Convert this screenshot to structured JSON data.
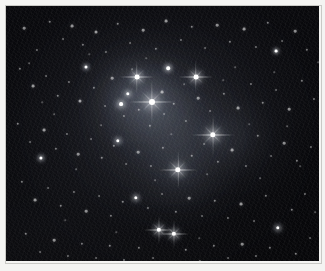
{
  "image": {
    "kind": "astrophotograph",
    "subject": "Pleiades open star cluster with reflection nebulosity",
    "presentation": "monochrome photographic print with light paper border",
    "background_color": "#050507",
    "star_color": "#ffffff",
    "nebula_color": "#aebacd",
    "border_color": "#f4f4f2",
    "plate": {
      "x": 6,
      "y": 6,
      "width": 313,
      "height": 255
    }
  },
  "nebulosity": [
    {
      "name": "core-reflection-glow",
      "cx": 148,
      "cy": 108,
      "rx": 62,
      "ry": 56,
      "opacity": 0.42,
      "blur": 26
    },
    {
      "name": "maia-nebula-glow",
      "cx": 130,
      "cy": 80,
      "rx": 34,
      "ry": 30,
      "opacity": 0.4,
      "blur": 18
    },
    {
      "name": "alcyone-nebula-glow",
      "cx": 146,
      "cy": 96,
      "rx": 30,
      "ry": 26,
      "opacity": 0.46,
      "blur": 16
    },
    {
      "name": "merope-nebula-glow",
      "cx": 172,
      "cy": 166,
      "rx": 34,
      "ry": 30,
      "opacity": 0.4,
      "blur": 18
    },
    {
      "name": "east-streak-nebula-glow",
      "cx": 222,
      "cy": 132,
      "rx": 44,
      "ry": 26,
      "opacity": 0.38,
      "blur": 18
    },
    {
      "name": "electra-nebula-glow",
      "cx": 116,
      "cy": 94,
      "rx": 24,
      "ry": 22,
      "opacity": 0.3,
      "blur": 14
    },
    {
      "name": "bridge-nebula-glow",
      "cx": 170,
      "cy": 132,
      "rx": 40,
      "ry": 34,
      "opacity": 0.22,
      "blur": 22
    },
    {
      "name": "outer-halo-glow",
      "cx": 162,
      "cy": 122,
      "rx": 92,
      "ry": 80,
      "opacity": 0.16,
      "blur": 40
    }
  ],
  "bright_stars": [
    {
      "name": "alcyone",
      "x": 146,
      "y": 96,
      "size": 6.0,
      "halo": 26,
      "spikes": true,
      "brightness": 1.0
    },
    {
      "name": "maia",
      "x": 131,
      "y": 71,
      "size": 4.8,
      "halo": 19,
      "spikes": true,
      "brightness": 0.92
    },
    {
      "name": "atlas",
      "x": 190,
      "y": 71,
      "size": 4.8,
      "halo": 19,
      "spikes": true,
      "brightness": 0.92
    },
    {
      "name": "merope",
      "x": 172,
      "y": 164,
      "size": 5.4,
      "halo": 22,
      "spikes": true,
      "brightness": 0.96
    },
    {
      "name": "east-nebula-star",
      "x": 207,
      "y": 129,
      "size": 5.4,
      "halo": 24,
      "spikes": true,
      "brightness": 0.96
    },
    {
      "name": "electra",
      "x": 115,
      "y": 98,
      "size": 3.8,
      "halo": 14,
      "spikes": false,
      "brightness": 0.84
    },
    {
      "name": "taygeta",
      "x": 122,
      "y": 88,
      "size": 3.4,
      "halo": 12,
      "spikes": false,
      "brightness": 0.8
    },
    {
      "name": "pleione",
      "x": 162,
      "y": 62,
      "size": 3.6,
      "halo": 13,
      "spikes": false,
      "brightness": 0.82
    },
    {
      "name": "asterope",
      "x": 112,
      "y": 135,
      "size": 3.4,
      "halo": 12,
      "spikes": false,
      "brightness": 0.78
    },
    {
      "name": "lower-pair-west",
      "x": 153,
      "y": 224,
      "size": 4.4,
      "halo": 17,
      "spikes": true,
      "brightness": 0.9
    },
    {
      "name": "lower-pair-east",
      "x": 168,
      "y": 228,
      "size": 4.4,
      "halo": 17,
      "spikes": true,
      "brightness": 0.9
    },
    {
      "name": "south-field-star",
      "x": 130,
      "y": 192,
      "size": 3.4,
      "halo": 12,
      "spikes": false,
      "brightness": 0.8
    },
    {
      "name": "west-field-star",
      "x": 35,
      "y": 152,
      "size": 3.2,
      "halo": 11,
      "spikes": false,
      "brightness": 0.76
    },
    {
      "name": "east-field-star",
      "x": 272,
      "y": 222,
      "size": 3.4,
      "halo": 12,
      "spikes": false,
      "brightness": 0.78
    },
    {
      "name": "north-field-star",
      "x": 80,
      "y": 61,
      "size": 3.0,
      "halo": 10,
      "spikes": false,
      "brightness": 0.74
    },
    {
      "name": "northeast-field-star",
      "x": 270,
      "y": 45,
      "size": 2.8,
      "halo": 9,
      "spikes": false,
      "brightness": 0.72
    }
  ],
  "field_stars": [
    {
      "x": 18,
      "y": 22,
      "s": 1.4,
      "b": 0.5
    },
    {
      "x": 31,
      "y": 44,
      "s": 1.1,
      "b": 0.4
    },
    {
      "x": 44,
      "y": 16,
      "s": 1.3,
      "b": 0.46
    },
    {
      "x": 57,
      "y": 33,
      "s": 1.0,
      "b": 0.38
    },
    {
      "x": 66,
      "y": 20,
      "s": 1.5,
      "b": 0.55
    },
    {
      "x": 77,
      "y": 39,
      "s": 1.2,
      "b": 0.44
    },
    {
      "x": 90,
      "y": 26,
      "s": 1.6,
      "b": 0.58
    },
    {
      "x": 100,
      "y": 46,
      "s": 1.1,
      "b": 0.4
    },
    {
      "x": 112,
      "y": 18,
      "s": 1.3,
      "b": 0.48
    },
    {
      "x": 124,
      "y": 37,
      "s": 1.0,
      "b": 0.36
    },
    {
      "x": 137,
      "y": 24,
      "s": 1.4,
      "b": 0.52
    },
    {
      "x": 150,
      "y": 43,
      "s": 1.2,
      "b": 0.44
    },
    {
      "x": 160,
      "y": 15,
      "s": 1.5,
      "b": 0.55
    },
    {
      "x": 175,
      "y": 34,
      "s": 1.1,
      "b": 0.4
    },
    {
      "x": 186,
      "y": 21,
      "s": 1.3,
      "b": 0.48
    },
    {
      "x": 199,
      "y": 42,
      "s": 1.0,
      "b": 0.36
    },
    {
      "x": 211,
      "y": 19,
      "s": 1.4,
      "b": 0.52
    },
    {
      "x": 224,
      "y": 36,
      "s": 1.2,
      "b": 0.44
    },
    {
      "x": 238,
      "y": 23,
      "s": 1.5,
      "b": 0.56
    },
    {
      "x": 250,
      "y": 41,
      "s": 1.1,
      "b": 0.4
    },
    {
      "x": 262,
      "y": 17,
      "s": 1.3,
      "b": 0.47
    },
    {
      "x": 276,
      "y": 35,
      "s": 1.0,
      "b": 0.36
    },
    {
      "x": 289,
      "y": 25,
      "s": 1.4,
      "b": 0.52
    },
    {
      "x": 301,
      "y": 44,
      "s": 1.2,
      "b": 0.43
    },
    {
      "x": 14,
      "y": 63,
      "s": 1.2,
      "b": 0.44
    },
    {
      "x": 27,
      "y": 80,
      "s": 1.5,
      "b": 0.56
    },
    {
      "x": 40,
      "y": 70,
      "s": 1.0,
      "b": 0.36
    },
    {
      "x": 52,
      "y": 90,
      "s": 1.3,
      "b": 0.48
    },
    {
      "x": 63,
      "y": 76,
      "s": 1.1,
      "b": 0.4
    },
    {
      "x": 74,
      "y": 95,
      "s": 1.6,
      "b": 0.6
    },
    {
      "x": 88,
      "y": 82,
      "s": 1.2,
      "b": 0.44
    },
    {
      "x": 99,
      "y": 100,
      "s": 1.0,
      "b": 0.36
    },
    {
      "x": 106,
      "y": 72,
      "s": 1.4,
      "b": 0.52
    },
    {
      "x": 118,
      "y": 110,
      "s": 1.1,
      "b": 0.4
    },
    {
      "x": 133,
      "y": 104,
      "s": 1.3,
      "b": 0.48
    },
    {
      "x": 144,
      "y": 120,
      "s": 1.2,
      "b": 0.44
    },
    {
      "x": 156,
      "y": 86,
      "s": 1.5,
      "b": 0.56
    },
    {
      "x": 158,
      "y": 108,
      "s": 1.0,
      "b": 0.36
    },
    {
      "x": 168,
      "y": 98,
      "s": 1.3,
      "b": 0.48
    },
    {
      "x": 180,
      "y": 115,
      "s": 1.1,
      "b": 0.4
    },
    {
      "x": 192,
      "y": 92,
      "s": 1.4,
      "b": 0.52
    },
    {
      "x": 204,
      "y": 105,
      "s": 1.0,
      "b": 0.36
    },
    {
      "x": 218,
      "y": 88,
      "s": 1.2,
      "b": 0.44
    },
    {
      "x": 232,
      "y": 102,
      "s": 1.5,
      "b": 0.56
    },
    {
      "x": 245,
      "y": 78,
      "s": 1.1,
      "b": 0.4
    },
    {
      "x": 257,
      "y": 97,
      "s": 1.3,
      "b": 0.48
    },
    {
      "x": 270,
      "y": 84,
      "s": 1.0,
      "b": 0.36
    },
    {
      "x": 283,
      "y": 103,
      "s": 1.4,
      "b": 0.52
    },
    {
      "x": 296,
      "y": 75,
      "s": 1.2,
      "b": 0.44
    },
    {
      "x": 308,
      "y": 93,
      "s": 1.1,
      "b": 0.4
    },
    {
      "x": 12,
      "y": 118,
      "s": 1.3,
      "b": 0.48
    },
    {
      "x": 24,
      "y": 136,
      "s": 1.0,
      "b": 0.36
    },
    {
      "x": 38,
      "y": 124,
      "s": 1.5,
      "b": 0.56
    },
    {
      "x": 50,
      "y": 143,
      "s": 1.2,
      "b": 0.44
    },
    {
      "x": 61,
      "y": 128,
      "s": 1.1,
      "b": 0.4
    },
    {
      "x": 72,
      "y": 148,
      "s": 1.4,
      "b": 0.52
    },
    {
      "x": 85,
      "y": 133,
      "s": 1.0,
      "b": 0.36
    },
    {
      "x": 96,
      "y": 152,
      "s": 1.3,
      "b": 0.48
    },
    {
      "x": 108,
      "y": 140,
      "s": 1.2,
      "b": 0.44
    },
    {
      "x": 120,
      "y": 158,
      "s": 1.0,
      "b": 0.36
    },
    {
      "x": 132,
      "y": 146,
      "s": 1.4,
      "b": 0.52
    },
    {
      "x": 145,
      "y": 160,
      "s": 1.1,
      "b": 0.4
    },
    {
      "x": 157,
      "y": 142,
      "s": 1.2,
      "b": 0.44
    },
    {
      "x": 186,
      "y": 150,
      "s": 1.3,
      "b": 0.48
    },
    {
      "x": 198,
      "y": 138,
      "s": 1.0,
      "b": 0.36
    },
    {
      "x": 212,
      "y": 156,
      "s": 1.2,
      "b": 0.44
    },
    {
      "x": 226,
      "y": 144,
      "s": 1.5,
      "b": 0.56
    },
    {
      "x": 240,
      "y": 160,
      "s": 1.1,
      "b": 0.4
    },
    {
      "x": 252,
      "y": 130,
      "s": 1.3,
      "b": 0.48
    },
    {
      "x": 265,
      "y": 150,
      "s": 1.0,
      "b": 0.36
    },
    {
      "x": 278,
      "y": 137,
      "s": 1.4,
      "b": 0.52
    },
    {
      "x": 291,
      "y": 155,
      "s": 1.2,
      "b": 0.44
    },
    {
      "x": 305,
      "y": 141,
      "s": 1.1,
      "b": 0.4
    },
    {
      "x": 16,
      "y": 176,
      "s": 1.2,
      "b": 0.44
    },
    {
      "x": 29,
      "y": 194,
      "s": 1.5,
      "b": 0.56
    },
    {
      "x": 42,
      "y": 182,
      "s": 1.0,
      "b": 0.36
    },
    {
      "x": 55,
      "y": 200,
      "s": 1.3,
      "b": 0.48
    },
    {
      "x": 68,
      "y": 186,
      "s": 1.1,
      "b": 0.4
    },
    {
      "x": 80,
      "y": 205,
      "s": 1.4,
      "b": 0.52
    },
    {
      "x": 93,
      "y": 190,
      "s": 1.0,
      "b": 0.36
    },
    {
      "x": 105,
      "y": 210,
      "s": 1.2,
      "b": 0.44
    },
    {
      "x": 117,
      "y": 196,
      "s": 1.3,
      "b": 0.48
    },
    {
      "x": 142,
      "y": 202,
      "s": 1.1,
      "b": 0.4
    },
    {
      "x": 156,
      "y": 188,
      "s": 1.0,
      "b": 0.36
    },
    {
      "x": 170,
      "y": 206,
      "s": 1.2,
      "b": 0.44
    },
    {
      "x": 183,
      "y": 192,
      "s": 1.4,
      "b": 0.52
    },
    {
      "x": 196,
      "y": 210,
      "s": 1.0,
      "b": 0.36
    },
    {
      "x": 209,
      "y": 195,
      "s": 1.3,
      "b": 0.48
    },
    {
      "x": 222,
      "y": 212,
      "s": 1.1,
      "b": 0.4
    },
    {
      "x": 235,
      "y": 198,
      "s": 1.5,
      "b": 0.56
    },
    {
      "x": 248,
      "y": 215,
      "s": 1.0,
      "b": 0.36
    },
    {
      "x": 260,
      "y": 190,
      "s": 1.2,
      "b": 0.44
    },
    {
      "x": 286,
      "y": 204,
      "s": 1.3,
      "b": 0.48
    },
    {
      "x": 299,
      "y": 188,
      "s": 1.1,
      "b": 0.4
    },
    {
      "x": 20,
      "y": 228,
      "s": 1.3,
      "b": 0.48
    },
    {
      "x": 34,
      "y": 246,
      "s": 1.0,
      "b": 0.36
    },
    {
      "x": 48,
      "y": 234,
      "s": 1.4,
      "b": 0.52
    },
    {
      "x": 62,
      "y": 250,
      "s": 1.1,
      "b": 0.4
    },
    {
      "x": 76,
      "y": 238,
      "s": 1.2,
      "b": 0.44
    },
    {
      "x": 90,
      "y": 252,
      "s": 1.0,
      "b": 0.36
    },
    {
      "x": 104,
      "y": 240,
      "s": 1.3,
      "b": 0.48
    },
    {
      "x": 118,
      "y": 254,
      "s": 1.1,
      "b": 0.4
    },
    {
      "x": 133,
      "y": 242,
      "s": 1.2,
      "b": 0.44
    },
    {
      "x": 147,
      "y": 252,
      "s": 1.0,
      "b": 0.36
    },
    {
      "x": 180,
      "y": 244,
      "s": 1.3,
      "b": 0.48
    },
    {
      "x": 194,
      "y": 255,
      "s": 1.1,
      "b": 0.4
    },
    {
      "x": 208,
      "y": 240,
      "s": 1.2,
      "b": 0.44
    },
    {
      "x": 222,
      "y": 252,
      "s": 1.0,
      "b": 0.36
    },
    {
      "x": 236,
      "y": 238,
      "s": 1.4,
      "b": 0.52
    },
    {
      "x": 250,
      "y": 250,
      "s": 1.1,
      "b": 0.4
    },
    {
      "x": 264,
      "y": 242,
      "s": 1.2,
      "b": 0.44
    },
    {
      "x": 290,
      "y": 248,
      "s": 1.3,
      "b": 0.48
    },
    {
      "x": 304,
      "y": 232,
      "s": 1.0,
      "b": 0.36
    },
    {
      "x": 23,
      "y": 57,
      "s": 0.9,
      "b": 0.3
    },
    {
      "x": 48,
      "y": 108,
      "s": 0.9,
      "b": 0.3
    },
    {
      "x": 70,
      "y": 163,
      "s": 0.9,
      "b": 0.3
    },
    {
      "x": 95,
      "y": 119,
      "s": 0.9,
      "b": 0.3
    },
    {
      "x": 126,
      "y": 63,
      "s": 0.9,
      "b": 0.3
    },
    {
      "x": 149,
      "y": 174,
      "s": 0.9,
      "b": 0.3
    },
    {
      "x": 178,
      "y": 78,
      "s": 0.9,
      "b": 0.3
    },
    {
      "x": 201,
      "y": 168,
      "s": 0.9,
      "b": 0.3
    },
    {
      "x": 229,
      "y": 61,
      "s": 0.9,
      "b": 0.3
    },
    {
      "x": 254,
      "y": 172,
      "s": 0.9,
      "b": 0.3
    },
    {
      "x": 281,
      "y": 120,
      "s": 0.9,
      "b": 0.3
    },
    {
      "x": 309,
      "y": 206,
      "s": 0.9,
      "b": 0.3
    },
    {
      "x": 36,
      "y": 96,
      "s": 0.8,
      "b": 0.26
    },
    {
      "x": 59,
      "y": 214,
      "s": 0.8,
      "b": 0.26
    },
    {
      "x": 83,
      "y": 48,
      "s": 0.8,
      "b": 0.26
    },
    {
      "x": 110,
      "y": 226,
      "s": 0.8,
      "b": 0.26
    },
    {
      "x": 140,
      "y": 52,
      "s": 0.8,
      "b": 0.26
    },
    {
      "x": 165,
      "y": 128,
      "s": 0.8,
      "b": 0.26
    },
    {
      "x": 193,
      "y": 232,
      "s": 0.8,
      "b": 0.26
    },
    {
      "x": 217,
      "y": 74,
      "s": 0.8,
      "b": 0.26
    },
    {
      "x": 243,
      "y": 118,
      "s": 0.8,
      "b": 0.26
    },
    {
      "x": 268,
      "y": 66,
      "s": 0.8,
      "b": 0.26
    },
    {
      "x": 294,
      "y": 160,
      "s": 0.8,
      "b": 0.26
    },
    {
      "x": 312,
      "y": 56,
      "s": 0.8,
      "b": 0.26
    }
  ]
}
